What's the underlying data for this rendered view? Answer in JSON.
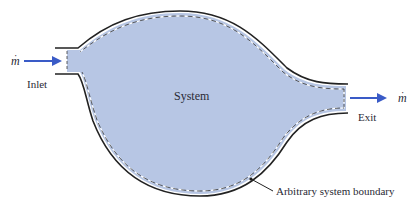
{
  "diagram": {
    "type": "control-volume schematic",
    "labels": {
      "system": "System",
      "inlet": "Inlet",
      "exit": "Exit",
      "boundary": "Arbitrary system boundary",
      "mass_flow_in": "m",
      "mass_flow_out": "m",
      "mass_flow_dot": "·"
    },
    "colors": {
      "system_fill": "#b7c6e4",
      "outline": "#222222",
      "dashed_boundary": "#ffffff",
      "arrow": "#3a5bc7",
      "text": "#2a2a35"
    }
  }
}
